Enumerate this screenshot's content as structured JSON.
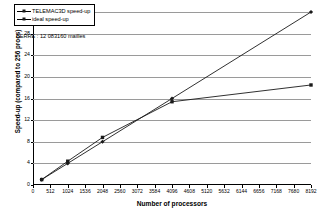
{
  "chart_data": {
    "type": "line",
    "title": "",
    "xlabel": "Number of processors",
    "ylabel": "Speed-up (compared to 256 procs)",
    "xlim": [
      0,
      8192
    ],
    "ylim": [
      0,
      32
    ],
    "grid": true,
    "legend_position": "top-left",
    "xticks": [
      0,
      512,
      1024,
      1536,
      2048,
      2560,
      3072,
      3584,
      4096,
      4608,
      5120,
      5632,
      6144,
      6656,
      7168,
      7680,
      8192
    ],
    "xtick_labels": [
      "0",
      "512",
      "1024",
      "1536",
      "2048",
      "2560",
      "3072",
      "3584",
      "4096",
      "4608",
      "5120",
      "5632",
      "6144",
      "6656",
      "7168",
      "7680",
      "8192"
    ],
    "yticks": [
      0,
      4,
      8,
      12,
      16,
      20,
      24,
      28,
      32
    ],
    "ytick_labels": [
      "0",
      "4",
      "8",
      "12",
      "16",
      "20",
      "24",
      "28",
      "32"
    ],
    "x": [
      256,
      1024,
      2048,
      4096,
      8192
    ],
    "series": [
      {
        "name": "TELEMAC3D speed-up",
        "marker": "square",
        "color": "#1a1a1a",
        "values": [
          1.0,
          4.4,
          8.8,
          15.4,
          18.5
        ]
      },
      {
        "name": "ideal speed-up",
        "marker": "diamond",
        "color": "#1a1a1a",
        "values": [
          1.0,
          4.0,
          8.0,
          16.0,
          32.0
        ]
      }
    ],
    "annotations": [
      {
        "text": "BERRE : 12 083160 mailles",
        "sub": "··"
      }
    ]
  },
  "legend": {
    "items": [
      {
        "label": "TELEMAC3D speed-up"
      },
      {
        "label": "ideal speed-up"
      }
    ]
  },
  "annotation": {
    "line1": "BERRE : 12 083160 mailles",
    "line2": ".."
  },
  "axes": {
    "x_title": "Number of processors",
    "y_title": "Speed-up (compared to 256 procs)"
  }
}
